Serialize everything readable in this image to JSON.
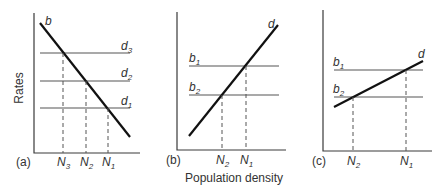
{
  "figure": {
    "y_axis_label": "Rates",
    "x_axis_label": "Population density",
    "panels": [
      {
        "id": "a",
        "label": "(a)",
        "sloped_line": {
          "name": "b",
          "sub": ""
        },
        "horizontal_lines": [
          {
            "name": "d",
            "sub": "3"
          },
          {
            "name": "d",
            "sub": "2"
          },
          {
            "name": "d",
            "sub": "1"
          }
        ],
        "x_ticks": [
          {
            "name": "N",
            "sub": "3"
          },
          {
            "name": "N",
            "sub": "2"
          },
          {
            "name": "N",
            "sub": "1"
          }
        ]
      },
      {
        "id": "b",
        "label": "(b)",
        "sloped_line": {
          "name": "d",
          "sub": ""
        },
        "horizontal_lines": [
          {
            "name": "b",
            "sub": "1"
          },
          {
            "name": "b",
            "sub": "2"
          }
        ],
        "x_ticks": [
          {
            "name": "N",
            "sub": "2"
          },
          {
            "name": "N",
            "sub": "1"
          }
        ]
      },
      {
        "id": "c",
        "label": "(c)",
        "sloped_line": {
          "name": "d",
          "sub": ""
        },
        "horizontal_lines": [
          {
            "name": "b",
            "sub": "1"
          },
          {
            "name": "b",
            "sub": "2"
          }
        ],
        "x_ticks": [
          {
            "name": "N",
            "sub": "2"
          },
          {
            "name": "N",
            "sub": "1"
          }
        ]
      }
    ]
  }
}
